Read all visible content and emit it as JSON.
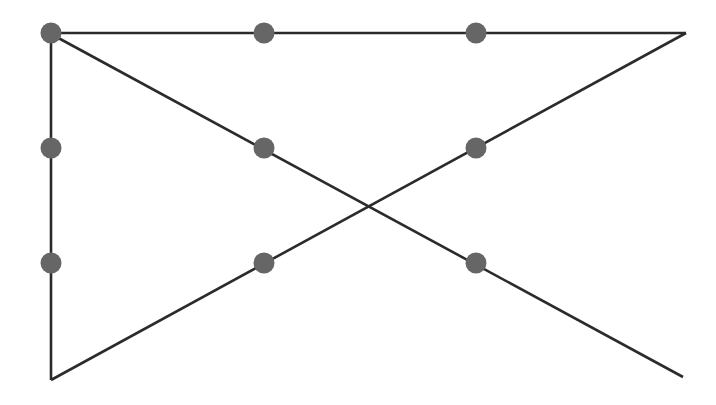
{
  "canvas": {
    "width": 716,
    "height": 405,
    "background_color": "#ffffff",
    "title": "Line drawing with marked points"
  },
  "style": {
    "line_color": "#2b2b2b",
    "line_width": 2.6,
    "node_fill": "#666666",
    "node_radius": 10.5
  },
  "chart_data": {
    "type": "scatter",
    "title": "",
    "xlabel": "",
    "ylabel": "",
    "xlim": [
      0,
      716
    ],
    "ylim": [
      405,
      0
    ],
    "grid": false,
    "legend": "none",
    "annotations": [],
    "vertices": [
      {
        "id": "top-left",
        "x": 51,
        "y": 34
      },
      {
        "id": "top-right",
        "x": 686,
        "y": 33
      },
      {
        "id": "bottom-left",
        "x": 51,
        "y": 380
      },
      {
        "id": "bottom-right-end",
        "x": 683,
        "y": 377
      }
    ],
    "edges": [
      {
        "id": "top-horizontal-edge",
        "x1": 51,
        "y1": 33,
        "x2": 686,
        "y2": 33
      },
      {
        "id": "left-vertical-edge",
        "x1": 51,
        "y1": 34,
        "x2": 51,
        "y2": 380
      },
      {
        "id": "descending-diagonal-edge",
        "x1": 51,
        "y1": 34,
        "x2": 683,
        "y2": 377
      },
      {
        "id": "ascending-diagonal-edge",
        "x1": 51,
        "y1": 380,
        "x2": 686,
        "y2": 33
      }
    ],
    "intersection": {
      "id": "diagonal-crossing",
      "x": 370,
      "y": 205,
      "marked": false
    },
    "x": [
      51,
      264,
      476,
      51,
      264,
      476,
      51,
      264,
      476
    ],
    "y": [
      33,
      33,
      33,
      148,
      148,
      148,
      263,
      263,
      263
    ],
    "points": [
      {
        "id": "node-1",
        "x": 51,
        "y": 33,
        "on_edges": [
          "top-horizontal-edge",
          "left-vertical-edge",
          "descending-diagonal-edge"
        ]
      },
      {
        "id": "node-2",
        "x": 264,
        "y": 33,
        "on_edges": [
          "top-horizontal-edge"
        ]
      },
      {
        "id": "node-3",
        "x": 476,
        "y": 33,
        "on_edges": [
          "top-horizontal-edge"
        ]
      },
      {
        "id": "node-4",
        "x": 51,
        "y": 148,
        "on_edges": [
          "left-vertical-edge"
        ]
      },
      {
        "id": "node-5",
        "x": 264,
        "y": 148,
        "on_edges": [
          "descending-diagonal-edge"
        ]
      },
      {
        "id": "node-6",
        "x": 476,
        "y": 148,
        "on_edges": [
          "ascending-diagonal-edge"
        ]
      },
      {
        "id": "node-7",
        "x": 51,
        "y": 263,
        "on_edges": [
          "left-vertical-edge"
        ]
      },
      {
        "id": "node-8",
        "x": 264,
        "y": 263,
        "on_edges": [
          "ascending-diagonal-edge"
        ]
      },
      {
        "id": "node-9",
        "x": 476,
        "y": 263,
        "on_edges": [
          "descending-diagonal-edge"
        ]
      }
    ]
  }
}
